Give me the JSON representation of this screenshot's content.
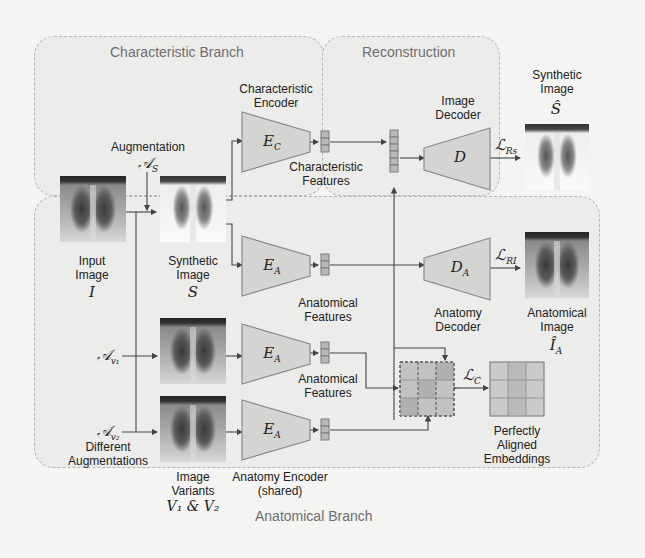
{
  "regions": {
    "characteristic": {
      "title": "Characteristic Branch"
    },
    "reconstruction": {
      "title": "Reconstruction"
    },
    "anatomical": {
      "title": "Anatomical Branch"
    }
  },
  "inputs": {
    "input_image": {
      "label_line1": "Input",
      "label_line2": "Image",
      "symbol": "I"
    },
    "augmentation": {
      "label": "Augmentation",
      "symbol": "𝒜",
      "subscript": "S"
    },
    "synthetic_image": {
      "label_line1": "Synthetic",
      "label_line2": "Image",
      "symbol": "S"
    },
    "aug_v1": {
      "symbol": "𝒜",
      "subscript": "v₁"
    },
    "aug_v2": {
      "symbol": "𝒜",
      "subscript": "v₂"
    },
    "different_augmentations": {
      "line1": "Different",
      "line2": "Augmentations"
    },
    "image_variants": {
      "line1": "Image",
      "line2": "Variants",
      "symbol": "V₁ & V₂"
    }
  },
  "encoders": {
    "characteristic": {
      "title_line1": "Characteristic",
      "title_line2": "Encoder",
      "symbol": "E",
      "subscript": "C"
    },
    "anatomy_top": {
      "symbol": "E",
      "subscript": "A"
    },
    "anatomy_v1": {
      "symbol": "E",
      "subscript": "A"
    },
    "anatomy_v2": {
      "symbol": "E",
      "subscript": "A"
    },
    "anatomy_caption_line1": "Anatomy Encoder",
    "anatomy_caption_line2": "(shared)"
  },
  "features": {
    "characteristic": {
      "line1": "Characteristic",
      "line2": "Features"
    },
    "anatomical_top": {
      "line1": "Anatomical",
      "line2": "Features"
    },
    "anatomical_v1": {
      "line1": "Anatomical",
      "line2": "Features"
    }
  },
  "decoders": {
    "image": {
      "title_line1": "Image",
      "title_line2": "Decoder",
      "symbol": "D"
    },
    "anatomy": {
      "title_line1": "Anatomy",
      "title_line2": "Decoder",
      "symbol": "D",
      "subscript": "A"
    }
  },
  "losses": {
    "rs": {
      "symbol": "ℒ",
      "subscript": "Rs"
    },
    "ri": {
      "symbol": "ℒ",
      "subscript": "RI"
    },
    "c": {
      "symbol": "ℒ",
      "subscript": "C"
    }
  },
  "outputs": {
    "synthetic_image": {
      "label_line1": "Synthetic",
      "label_line2": "Image",
      "symbol": "Ŝ"
    },
    "anatomical_image": {
      "label_line1": "Anatomical",
      "label_line2": "Image",
      "symbol": "Î",
      "subscript": "A"
    },
    "aligned_embeddings": {
      "line1": "Perfectly",
      "line2": "Aligned",
      "line3": "Embeddings"
    }
  },
  "colors": {
    "block_fill": "#d4d4d2",
    "block_stroke": "#8a8a8a",
    "feature_fill": "#b8b8b6",
    "matrix_fill": "#c2c2c0",
    "line": "#444444"
  }
}
